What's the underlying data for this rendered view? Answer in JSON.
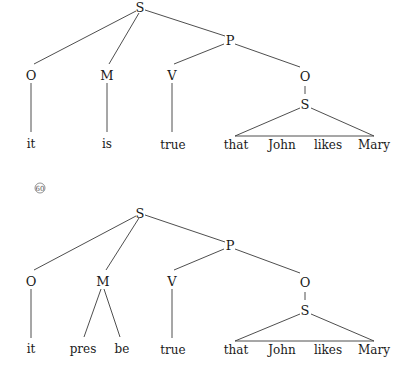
{
  "trees": [
    {
      "id": "tree-1",
      "nodes": {
        "root": "S",
        "predicate": "P",
        "object_left": "O",
        "modal": "M",
        "verb": "V",
        "object_right": "O",
        "embedded_s": "S"
      },
      "words": {
        "it": "it",
        "modal_word": "is",
        "true": "true",
        "that": "that",
        "john": "John",
        "likes": "likes",
        "mary": "Mary"
      }
    },
    {
      "id": "tree-2",
      "label": "60",
      "nodes": {
        "root": "S",
        "predicate": "P",
        "object_left": "O",
        "modal": "M",
        "verb": "V",
        "object_right": "O",
        "embedded_s": "S"
      },
      "words": {
        "it": "it",
        "pres": "pres",
        "be": "be",
        "true": "true",
        "that": "that",
        "john": "John",
        "likes": "likes",
        "mary": "Mary"
      }
    }
  ]
}
